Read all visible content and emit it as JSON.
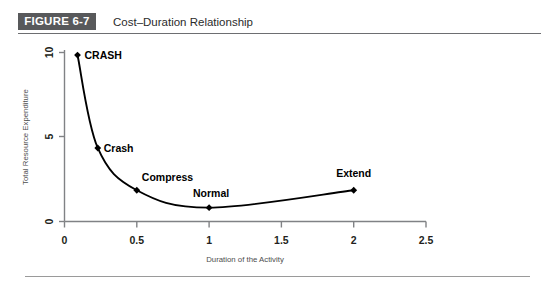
{
  "figure": {
    "badge": "FIGURE 6-7",
    "title": "Cost–Duration Relationship"
  },
  "chart_data": {
    "type": "line",
    "title": "Cost–Duration Relationship",
    "xlabel": "Duration of the Activity",
    "ylabel": "Total Resource Expenditure",
    "xlim": [
      0,
      2.5
    ],
    "ylim": [
      0,
      10
    ],
    "xticks": [
      "0",
      "0.5",
      "1",
      "1.5",
      "2",
      "2.5"
    ],
    "xtick_values": [
      0,
      0.5,
      1,
      1.5,
      2,
      2.5
    ],
    "yticks": [
      "0",
      "5",
      "10"
    ],
    "ytick_values": [
      0,
      5,
      10
    ],
    "grid": false,
    "legend": "none",
    "marker": "diamond",
    "points": [
      {
        "label": "CRASH",
        "x": 0.09,
        "y": 9.85
      },
      {
        "label": "Crash",
        "x": 0.23,
        "y": 4.35
      },
      {
        "label": "Compress",
        "x": 0.5,
        "y": 1.85
      },
      {
        "label": "Normal",
        "x": 1.0,
        "y": 0.82
      },
      {
        "label": "Extend",
        "x": 2.0,
        "y": 1.85
      }
    ],
    "series": [
      {
        "name": "Total Resource Expenditure",
        "x": [
          0.09,
          0.23,
          0.5,
          1.0,
          2.0
        ],
        "values": [
          9.85,
          4.35,
          1.85,
          0.82,
          1.85
        ]
      }
    ]
  },
  "colors": {
    "badge_background": "#58595b",
    "badge_text": "#ffffff",
    "rule": "#6d6e71",
    "axis": "#808285",
    "curve": "#000000",
    "marker": "#000000",
    "background": "#ffffff"
  }
}
